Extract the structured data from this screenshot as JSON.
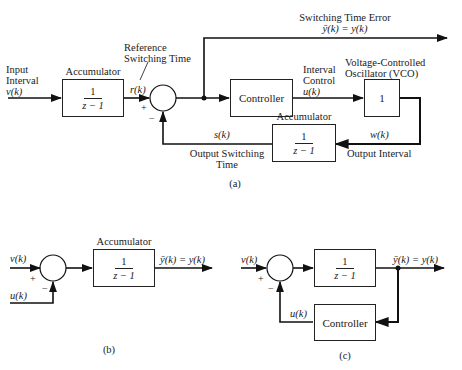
{
  "figure_a": {
    "caption": "(a)",
    "input": {
      "line1": "Input",
      "line2": "Interval",
      "signal": "v(k)"
    },
    "accumulator_top": {
      "title": "Accumulator",
      "numerator": "1",
      "denominator": "z − 1"
    },
    "reference": {
      "line1": "Reference",
      "line2": "Switching Time",
      "signal": "r(k)"
    },
    "summer": {
      "plus": "+",
      "minus": "−"
    },
    "error_output": {
      "label": "Switching Time Error",
      "equation": "ȳ(k) = y(k)"
    },
    "controller": {
      "label": "Controller"
    },
    "interval_control": {
      "line1": "Interval",
      "line2": "Control",
      "signal": "u(k)"
    },
    "vco": {
      "line1": "Voltage-Controlled",
      "line2": "Oscillator (VCO)",
      "gain": "1"
    },
    "accumulator_bottom": {
      "title": "Accumulator",
      "numerator": "1",
      "denominator": "z − 1"
    },
    "output_interval": {
      "signal": "w(k)",
      "label": "Output Interval"
    },
    "output_switching": {
      "signal": "s(k)",
      "line1": "Output Switching",
      "line2": "Time"
    }
  },
  "figure_b": {
    "caption": "(b)",
    "input_v": "v(k)",
    "input_u": "u(k)",
    "plus": "+",
    "minus": "−",
    "accumulator": {
      "title": "Accumulator",
      "numerator": "1",
      "denominator": "z − 1"
    },
    "output": "ȳ(k) = y(k)"
  },
  "figure_c": {
    "caption": "(c)",
    "input_v": "v(k)",
    "plus": "+",
    "minus": "−",
    "block": {
      "numerator": "1",
      "denominator": "z − 1"
    },
    "output": "ȳ(k) = y(k)",
    "feedback_signal": "u(k)",
    "controller": {
      "label": "Controller"
    }
  }
}
